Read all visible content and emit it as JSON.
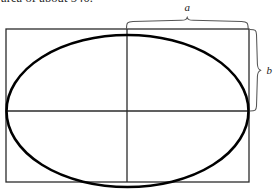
{
  "caption": {
    "text": "area of about 540."
  },
  "figure": {
    "type": "geometry-diagram",
    "labels": {
      "semi_major_axis": "a",
      "semi_minor_axis": "b"
    },
    "colors": {
      "ellipse_stroke": "#000000",
      "rectangle_stroke": "#2b2b2b",
      "axis_stroke": "#2b2b2b",
      "brace_stroke": "#555555",
      "label_fill": "#1a1a1a",
      "background": "#ffffff"
    },
    "geometry": {
      "rect_left": 6,
      "rect_top": 29,
      "rect_right": 249,
      "rect_bottom": 182,
      "center_x": 127,
      "center_y": 111,
      "ellipse_rx": 121,
      "ellipse_ry": 76,
      "top_brace_start_x": 127,
      "top_brace_end_x": 249,
      "top_brace_y": 22,
      "right_brace_start_y": 29,
      "right_brace_end_y": 111,
      "right_brace_x": 258
    }
  }
}
